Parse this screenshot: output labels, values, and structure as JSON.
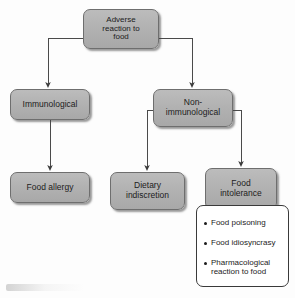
{
  "diagram": {
    "type": "flowchart",
    "colors": {
      "node_fill": "#b2b2b2",
      "node_border": "#6e6e6e",
      "list_fill": "#ffffff",
      "list_border": "#3a3a3a",
      "connector": "#4a4a4a",
      "text": "#1c1c1c"
    },
    "nodes": {
      "adverse": {
        "id": "adverse-reaction-to-food",
        "lines": [
          "Adverse",
          "reaction to",
          "food"
        ],
        "level": 0
      },
      "immunological": {
        "id": "immunological",
        "lines": [
          "Immunological"
        ],
        "level": 1
      },
      "non_immunological": {
        "id": "non-immunological",
        "lines": [
          "Non-",
          "immunological"
        ],
        "level": 1
      },
      "food_allergy": {
        "id": "food-allergy",
        "lines": [
          "Food allergy"
        ],
        "level": 2
      },
      "dietary_indiscretion": {
        "id": "dietary-indiscretion",
        "lines": [
          "Dietary",
          "indiscretion"
        ],
        "level": 2
      },
      "food_intolerance": {
        "id": "food-intolerance",
        "lines": [
          "Food",
          "intolerance"
        ],
        "level": 2
      }
    },
    "bullet_list": {
      "id": "food-intolerance-examples",
      "items": [
        {
          "lines": [
            "Food poisoning"
          ]
        },
        {
          "lines": [
            "Food idiosyncrasy"
          ]
        },
        {
          "lines": [
            "Pharmacological",
            "reaction to food"
          ]
        }
      ]
    },
    "edges": [
      {
        "from": "adverse-reaction-to-food",
        "to": "immunological"
      },
      {
        "from": "adverse-reaction-to-food",
        "to": "non-immunological"
      },
      {
        "from": "immunological",
        "to": "food-allergy"
      },
      {
        "from": "non-immunological",
        "to": "dietary-indiscretion"
      },
      {
        "from": "non-immunological",
        "to": "food-intolerance"
      }
    ]
  }
}
